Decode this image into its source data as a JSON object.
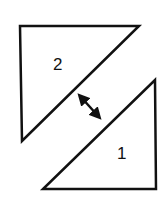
{
  "diagram": {
    "stroke_color": "#111111",
    "background": "#ffffff",
    "shapes": [
      {
        "id": "triangle-2",
        "label": "2",
        "points": "20,26 139,26 22,141",
        "label_pos": [
          59,
          70
        ]
      },
      {
        "id": "triangle-1",
        "label": "1",
        "points": "155,80 156,189 43,189",
        "label_pos": [
          123,
          159
        ]
      }
    ],
    "arrow": {
      "type": "double-headed",
      "from": [
        78,
        94
      ],
      "to": [
        101,
        119
      ]
    }
  }
}
